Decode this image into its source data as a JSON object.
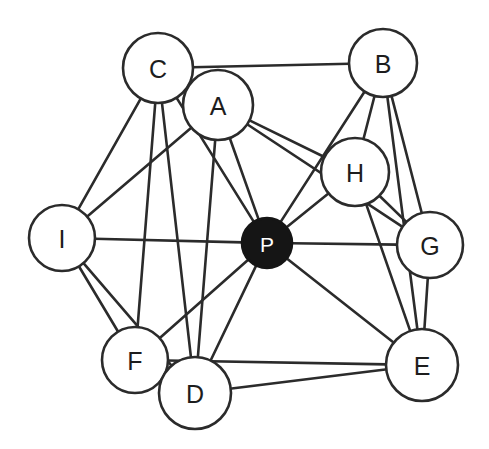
{
  "diagram": {
    "type": "undirected-graph",
    "background_color": "#ffffff",
    "edge_color": "#2b2b2b",
    "node_fill_color": "#ffffff",
    "node_stroke_color": "#2b2b2b",
    "hub_fill_color": "#151515",
    "hub_label_color": "#ffffff"
  },
  "nodes": [
    {
      "id": "C",
      "label": "C",
      "cx": 158,
      "cy": 68,
      "r": 35,
      "filled": false
    },
    {
      "id": "A",
      "label": "A",
      "cx": 218,
      "cy": 105,
      "r": 35,
      "filled": false
    },
    {
      "id": "B",
      "label": "B",
      "cx": 383,
      "cy": 63,
      "r": 34,
      "filled": false
    },
    {
      "id": "H",
      "label": "H",
      "cx": 355,
      "cy": 172,
      "r": 34,
      "filled": false
    },
    {
      "id": "G",
      "label": "G",
      "cx": 430,
      "cy": 245,
      "r": 33,
      "filled": false
    },
    {
      "id": "I",
      "label": "I",
      "cx": 62,
      "cy": 238,
      "r": 33,
      "filled": false
    },
    {
      "id": "P",
      "label": "P",
      "cx": 267,
      "cy": 243,
      "r": 25,
      "filled": true
    },
    {
      "id": "F",
      "label": "F",
      "cx": 135,
      "cy": 360,
      "r": 33,
      "filled": false
    },
    {
      "id": "D",
      "label": "D",
      "cx": 195,
      "cy": 393,
      "r": 36,
      "filled": false
    },
    {
      "id": "E",
      "label": "E",
      "cx": 422,
      "cy": 365,
      "r": 36,
      "filled": false
    }
  ],
  "edges": [
    {
      "from": "C",
      "to": "B"
    },
    {
      "from": "C",
      "to": "A"
    },
    {
      "from": "C",
      "to": "I"
    },
    {
      "from": "C",
      "to": "F"
    },
    {
      "from": "C",
      "to": "D"
    },
    {
      "from": "C",
      "to": "P"
    },
    {
      "from": "A",
      "to": "H"
    },
    {
      "from": "A",
      "to": "G"
    },
    {
      "from": "A",
      "to": "P"
    },
    {
      "from": "A",
      "to": "D"
    },
    {
      "from": "A",
      "to": "I"
    },
    {
      "from": "B",
      "to": "H"
    },
    {
      "from": "B",
      "to": "G"
    },
    {
      "from": "B",
      "to": "E"
    },
    {
      "from": "B",
      "to": "P"
    },
    {
      "from": "H",
      "to": "G"
    },
    {
      "from": "H",
      "to": "E"
    },
    {
      "from": "H",
      "to": "P"
    },
    {
      "from": "G",
      "to": "P"
    },
    {
      "from": "G",
      "to": "E"
    },
    {
      "from": "I",
      "to": "P"
    },
    {
      "from": "I",
      "to": "F"
    },
    {
      "from": "I",
      "to": "D"
    },
    {
      "from": "P",
      "to": "F"
    },
    {
      "from": "P",
      "to": "D"
    },
    {
      "from": "P",
      "to": "E"
    },
    {
      "from": "F",
      "to": "D"
    },
    {
      "from": "F",
      "to": "E"
    },
    {
      "from": "D",
      "to": "E"
    }
  ]
}
